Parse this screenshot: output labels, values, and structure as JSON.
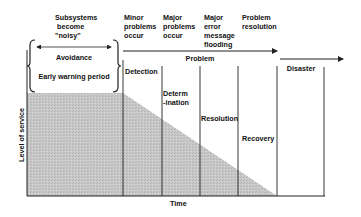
{
  "diagram": {
    "y_axis_label": "Level of service",
    "x_axis_label": "Time",
    "top_events": [
      {
        "id": "noisy",
        "text": "Subsystems\n become\n\"noisy\""
      },
      {
        "id": "minor",
        "text": "Minor\nproblems\noccur"
      },
      {
        "id": "major",
        "text": "Major\nproblems\noccur"
      },
      {
        "id": "flooding",
        "text": "Major\nerror\nmessage\nflooding"
      },
      {
        "id": "resolution",
        "text": "Problem\nresolution"
      }
    ],
    "phases": {
      "avoidance": "Avoidance",
      "early_warning": "Early warning period",
      "problem": "Problem",
      "disaster": "Disaster"
    },
    "stages": [
      {
        "id": "detection",
        "text": "Detection"
      },
      {
        "id": "determination",
        "text": "Determ\n-ination"
      },
      {
        "id": "resolution",
        "text": "Resolution"
      },
      {
        "id": "recovery",
        "text": "Recovery"
      }
    ],
    "colors": {
      "fill": "#c4c4c4",
      "line": "#222222"
    }
  }
}
